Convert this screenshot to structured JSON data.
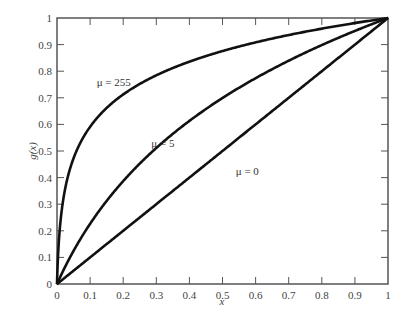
{
  "chart_data": {
    "type": "line",
    "title": "",
    "xlabel": "x",
    "ylabel": "g(x)",
    "xlim": [
      0,
      1
    ],
    "ylim": [
      0,
      1
    ],
    "grid": false,
    "legend": "inline curve labels",
    "x_ticks": [
      "0",
      "0.1",
      "0.2",
      "0.3",
      "0.4",
      "0.5",
      "0.6",
      "0.7",
      "0.8",
      "0.9",
      "1"
    ],
    "y_ticks": [
      "0",
      "0.1",
      "0.2",
      "0.3",
      "0.4",
      "0.5",
      "0.6",
      "0.7",
      "0.8",
      "0.9",
      "1"
    ],
    "x": [
      0,
      0.01,
      0.02,
      0.05,
      0.1,
      0.15,
      0.2,
      0.3,
      0.4,
      0.5,
      0.6,
      0.7,
      0.8,
      0.9,
      1.0
    ],
    "series": [
      {
        "name": "μ = 255",
        "values": [
          0,
          0.228,
          0.329,
          0.473,
          0.591,
          0.662,
          0.713,
          0.785,
          0.836,
          0.876,
          0.909,
          0.937,
          0.961,
          0.981,
          1.0
        ],
        "label_pos": [
          0.12,
          0.745
        ]
      },
      {
        "name": "μ = 5",
        "values": [
          0,
          0.027,
          0.053,
          0.126,
          0.226,
          0.311,
          0.387,
          0.511,
          0.613,
          0.699,
          0.774,
          0.839,
          0.898,
          0.951,
          1.0
        ],
        "label_pos": [
          0.285,
          0.515
        ]
      },
      {
        "name": "μ = 0",
        "values": [
          0,
          0.01,
          0.02,
          0.05,
          0.1,
          0.15,
          0.2,
          0.3,
          0.4,
          0.5,
          0.6,
          0.7,
          0.8,
          0.9,
          1.0
        ],
        "label_pos": [
          0.54,
          0.41
        ]
      }
    ]
  },
  "colors": {
    "curve": "#111111",
    "axis": "#555555",
    "text": "#444444"
  }
}
